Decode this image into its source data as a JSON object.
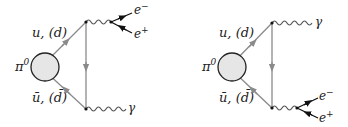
{
  "diagrams": [
    {
      "name": "left",
      "meson": "π",
      "meson_sup": "0",
      "quark_label": "u, (d)",
      "antiquark_label": "ū, (d̄)",
      "top_vertex": "virtual-photon-to-ee",
      "bottom_vertex": "real-photon",
      "e_minus": "e",
      "e_minus_sup": "−",
      "e_plus": "e",
      "e_plus_sup": "+",
      "gamma": "γ"
    },
    {
      "name": "right",
      "meson": "π",
      "meson_sup": "0",
      "quark_label": "u, (d)",
      "antiquark_label": "ū, (d̄)",
      "top_vertex": "real-photon",
      "bottom_vertex": "virtual-photon-to-ee",
      "e_minus": "e",
      "e_minus_sup": "−",
      "e_plus": "e",
      "e_plus_sup": "+",
      "gamma": "γ"
    }
  ],
  "colors": {
    "quark_line": "#8a8a8a",
    "blob_fill": "#e6e6e6",
    "blob_stroke": "#222222",
    "lepton_line": "#111111",
    "photon_line": "#555555"
  }
}
